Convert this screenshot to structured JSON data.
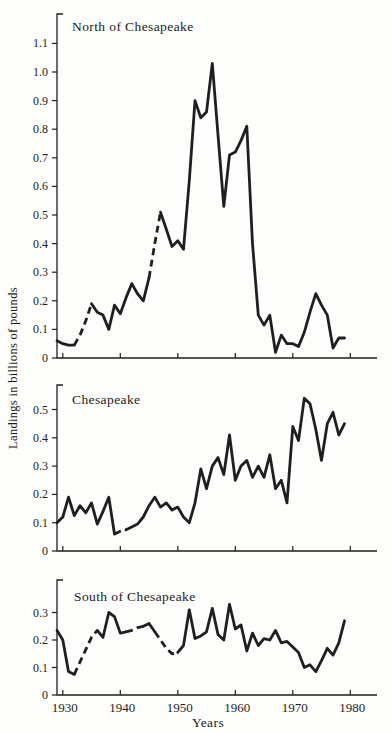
{
  "figure": {
    "y_axis_label": "Landings in billions of pounds",
    "x_axis_label": "Years",
    "ink_color": "#1f1f1f",
    "paper_color": "#fdfdfb",
    "dashed_note": "dashed segments indicate interpolated values"
  },
  "chart_data": [
    {
      "type": "line",
      "title": "North of Chesapeake",
      "ylabel": "Landings in billions of pounds",
      "xlabel": "Years",
      "year_start": 1929,
      "year_end": 1979,
      "year_step": 1,
      "x_ticks": [
        1930,
        1940,
        1950,
        1960,
        1970,
        1980
      ],
      "show_x_tick_labels": false,
      "y_ticks": [
        0,
        0.1,
        0.2,
        0.3,
        0.4,
        0.5,
        0.6,
        0.7,
        0.8,
        0.9,
        1.0,
        1.1
      ],
      "ylim": [
        0,
        1.2
      ],
      "values": [
        0.06,
        0.05,
        0.045,
        0.045,
        0.08,
        0.13,
        0.19,
        0.16,
        0.15,
        0.1,
        0.185,
        0.155,
        0.21,
        0.26,
        0.225,
        0.2,
        0.28,
        0.4,
        0.51,
        0.45,
        0.39,
        0.41,
        0.38,
        0.62,
        0.9,
        0.84,
        0.86,
        1.03,
        0.78,
        0.53,
        0.71,
        0.72,
        0.76,
        0.81,
        0.4,
        0.15,
        0.115,
        0.15,
        0.02,
        0.08,
        0.05,
        0.05,
        0.04,
        0.09,
        0.16,
        0.225,
        0.185,
        0.15,
        0.035,
        0.07,
        0.07
      ],
      "dashed_year_ranges": [
        [
          1932,
          1935
        ],
        [
          1945,
          1947
        ]
      ]
    },
    {
      "type": "line",
      "title": "Chesapeake",
      "ylabel": "Landings in billions of pounds",
      "xlabel": "Years",
      "year_start": 1929,
      "year_end": 1979,
      "year_step": 1,
      "x_ticks": [
        1930,
        1940,
        1950,
        1960,
        1970,
        1980
      ],
      "show_x_tick_labels": false,
      "y_ticks": [
        0,
        0.1,
        0.2,
        0.3,
        0.4,
        0.5
      ],
      "ylim": [
        0,
        0.59
      ],
      "values": [
        0.1,
        0.12,
        0.19,
        0.125,
        0.16,
        0.135,
        0.17,
        0.095,
        0.14,
        0.19,
        0.06,
        0.07,
        0.075,
        0.085,
        0.095,
        0.12,
        0.16,
        0.19,
        0.155,
        0.17,
        0.145,
        0.155,
        0.12,
        0.1,
        0.17,
        0.29,
        0.22,
        0.3,
        0.33,
        0.27,
        0.41,
        0.25,
        0.3,
        0.32,
        0.26,
        0.3,
        0.26,
        0.34,
        0.22,
        0.25,
        0.17,
        0.44,
        0.39,
        0.54,
        0.52,
        0.43,
        0.32,
        0.45,
        0.49,
        0.41,
        0.45
      ],
      "dashed_year_ranges": [
        [
          1939,
          1941
        ]
      ]
    },
    {
      "type": "line",
      "title": "South of Chesapeake",
      "ylabel": "Landings in billions of pounds",
      "xlabel": "Years",
      "year_start": 1929,
      "year_end": 1979,
      "year_step": 1,
      "x_ticks": [
        1930,
        1940,
        1950,
        1960,
        1970,
        1980
      ],
      "show_x_tick_labels": true,
      "x_tick_labels": [
        "1930",
        "1940",
        "1950",
        "1960",
        "1970",
        "1980"
      ],
      "y_ticks": [
        0,
        0.1,
        0.2,
        0.3
      ],
      "ylim": [
        0,
        0.42
      ],
      "values": [
        0.235,
        0.2,
        0.085,
        0.075,
        0.12,
        0.165,
        0.21,
        0.235,
        0.21,
        0.3,
        0.285,
        0.225,
        0.23,
        0.235,
        0.245,
        0.25,
        0.26,
        0.23,
        0.2,
        0.17,
        0.15,
        0.155,
        0.18,
        0.31,
        0.205,
        0.215,
        0.23,
        0.315,
        0.22,
        0.2,
        0.33,
        0.24,
        0.255,
        0.16,
        0.225,
        0.18,
        0.205,
        0.2,
        0.235,
        0.19,
        0.195,
        0.175,
        0.155,
        0.1,
        0.11,
        0.085,
        0.125,
        0.17,
        0.145,
        0.19,
        0.27
      ],
      "dashed_year_ranges": [
        [
          1932,
          1936
        ],
        [
          1941,
          1944
        ],
        [
          1946,
          1950
        ]
      ]
    }
  ]
}
